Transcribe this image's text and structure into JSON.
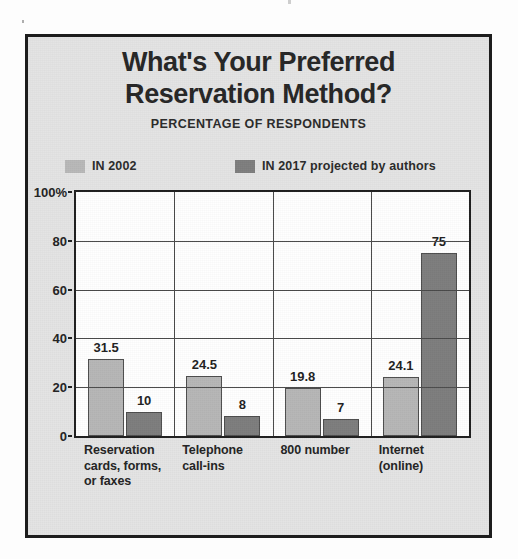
{
  "chart_data": {
    "type": "bar",
    "title": "What's Your Preferred Reservation Method?",
    "title_lines": [
      "What's Your Preferred",
      "Reservation Method?"
    ],
    "subtitle": "PERCENTAGE OF RESPONDENTS",
    "xlabel": "",
    "ylabel": "",
    "ylim": [
      0,
      100
    ],
    "yticks": [
      0,
      20,
      40,
      60,
      80,
      100
    ],
    "ytick_labels": [
      "0",
      "20",
      "40",
      "60",
      "80",
      "100%"
    ],
    "grid": true,
    "legend_position": "top",
    "categories": [
      "Reservation cards, forms, or faxes",
      "Telephone call-ins",
      "800 number",
      "Internet (online)"
    ],
    "category_lines": [
      [
        "Reservation",
        "cards, forms,",
        "or faxes"
      ],
      [
        "Telephone",
        "call-ins"
      ],
      [
        "800 number"
      ],
      [
        "Internet",
        "(online)"
      ]
    ],
    "series": [
      {
        "name": "IN 2002",
        "color": "#b6b6b6",
        "values": [
          31.5,
          24.5,
          19.8,
          24.1
        ],
        "labels": [
          "31.5",
          "24.5",
          "19.8",
          "24.1"
        ]
      },
      {
        "name": "IN 2017 projected by authors",
        "color": "#7d7d7d",
        "values": [
          10,
          8,
          7,
          75
        ],
        "labels": [
          "10",
          "8",
          "7",
          "75"
        ]
      }
    ],
    "annotations": [
      {
        "text": "75",
        "note": "value label flanked by short rules on the 75 gridline"
      }
    ]
  },
  "legend": {
    "items": [
      {
        "label": "IN 2002",
        "color": "#b6b6b6"
      },
      {
        "label": "IN 2017 projected by authors",
        "color": "#7d7d7d"
      }
    ]
  },
  "colors": {
    "series_2002": "#b6b6b6",
    "series_2017": "#7d7d7d",
    "frame": "#1d1d1d",
    "panel_background": "#e4e4e4",
    "plot_background": "#ffffff",
    "text": "#232323"
  }
}
